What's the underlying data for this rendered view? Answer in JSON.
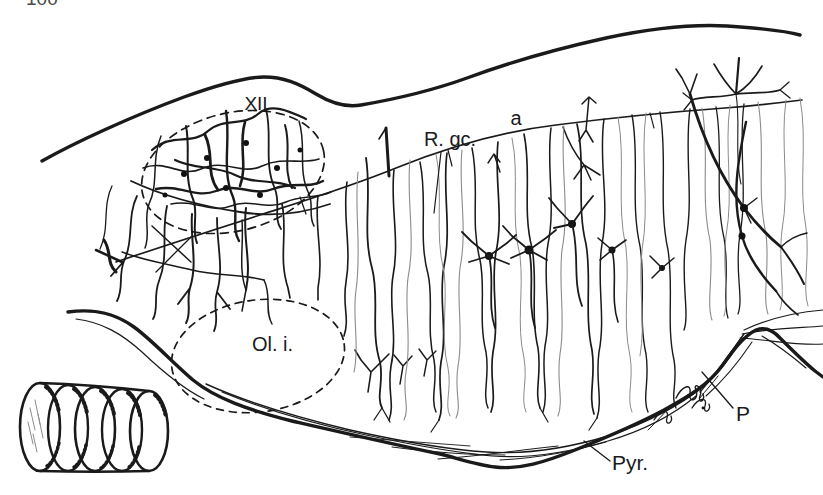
{
  "page": {
    "number": "100"
  },
  "figure": {
    "labels": {
      "xii": "XII",
      "r_gc": "R. gc.",
      "a": "a",
      "ol_i": "Ol. i.",
      "p": "P",
      "pyr": "Pyr."
    },
    "icon": "sectioned-cylinder",
    "colors": {
      "ink": "#1a1a1a",
      "paper": "#ffffff",
      "pale_fiber": "#8b8b8b"
    }
  }
}
